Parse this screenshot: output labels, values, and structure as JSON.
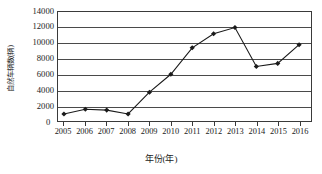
{
  "chart_data": {
    "type": "line",
    "title": "",
    "xlabel": "年份(年)",
    "ylabel": "自然车辆数(辆)",
    "categories": [
      "2005",
      "2006",
      "2007",
      "2008",
      "2009",
      "2010",
      "2011",
      "2012",
      "2013",
      "2014",
      "2015",
      "2016"
    ],
    "values": [
      900,
      1500,
      1400,
      900,
      3700,
      6000,
      9400,
      11200,
      12000,
      7000,
      7400,
      9800
    ],
    "series": [
      {
        "name": "自然车辆数",
        "values": [
          900,
          1500,
          1400,
          900,
          3700,
          6000,
          9400,
          11200,
          12000,
          7000,
          7400,
          9800
        ]
      }
    ],
    "xlim": [
      2005,
      2016
    ],
    "ylim": [
      0,
      14000
    ],
    "ytick_labels": [
      "0",
      "2000",
      "4000",
      "6000",
      "8000",
      "10000",
      "12000",
      "14000"
    ],
    "ytick_values": [
      0,
      2000,
      4000,
      6000,
      8000,
      10000,
      12000,
      14000
    ],
    "xtick_labels": [
      "2005",
      "2006",
      "2007",
      "2008",
      "2009",
      "2010",
      "2011",
      "2012",
      "2013",
      "2014",
      "2015",
      "2016"
    ],
    "grid": "horizontal",
    "legend": "none",
    "marker": "filled-diamond",
    "line_color": "#1a1a1a",
    "marker_color": "#1a1a1a",
    "grid_color": "#4a4a4a",
    "axis_color": "#3a3a3a",
    "background": "#ffffff"
  }
}
